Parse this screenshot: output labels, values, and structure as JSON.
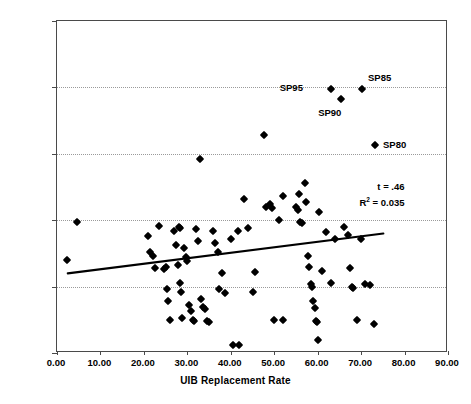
{
  "chart_data": {
    "type": "scatter",
    "title": "",
    "xlabel": "UIB Replacement Rate",
    "ylabel": "Unemployment Rate",
    "xlim": [
      0,
      90
    ],
    "ylim": [
      0,
      25
    ],
    "xticks": [
      "0.00",
      "10.00",
      "20.00",
      "30.00",
      "40.00",
      "50.00",
      "60.00",
      "70.00",
      "80.00",
      "90.00"
    ],
    "yticks": [
      "0.00",
      "5.00",
      "10.00",
      "15.00",
      "20.00",
      "25.00"
    ],
    "xtick_values": [
      0,
      10,
      20,
      30,
      40,
      50,
      60,
      70,
      80,
      90
    ],
    "ytick_values": [
      0,
      5,
      10,
      15,
      20,
      25
    ],
    "grid": "horizontal-dotted",
    "gridline_values": [
      5,
      10,
      15,
      20
    ],
    "legend": "none",
    "marker": "filled-diamond",
    "marker_color": "#000000",
    "points": [
      [
        2.2,
        7.0
      ],
      [
        4.6,
        9.9
      ],
      [
        21.0,
        8.8
      ],
      [
        21.4,
        7.6
      ],
      [
        22.2,
        7.3
      ],
      [
        22.6,
        6.4
      ],
      [
        23.4,
        9.6
      ],
      [
        24.6,
        6.3
      ],
      [
        25.0,
        6.5
      ],
      [
        25.4,
        4.8
      ],
      [
        25.6,
        3.9
      ],
      [
        26.0,
        2.5
      ],
      [
        27.0,
        9.2
      ],
      [
        27.4,
        8.1
      ],
      [
        27.8,
        6.6
      ],
      [
        28.0,
        9.5
      ],
      [
        28.2,
        9.4
      ],
      [
        28.4,
        5.3
      ],
      [
        28.6,
        4.6
      ],
      [
        28.8,
        2.6
      ],
      [
        29.2,
        7.9
      ],
      [
        29.6,
        7.2
      ],
      [
        30.0,
        6.9
      ],
      [
        30.4,
        3.6
      ],
      [
        30.8,
        3.2
      ],
      [
        31.2,
        2.5
      ],
      [
        31.6,
        2.4
      ],
      [
        32.0,
        9.3
      ],
      [
        32.4,
        8.4
      ],
      [
        33.0,
        14.6
      ],
      [
        33.2,
        4.1
      ],
      [
        33.6,
        3.5
      ],
      [
        34.0,
        3.3
      ],
      [
        34.6,
        2.4
      ],
      [
        35.0,
        2.3
      ],
      [
        36.0,
        9.2
      ],
      [
        36.4,
        8.3
      ],
      [
        37.0,
        7.6
      ],
      [
        37.4,
        4.8
      ],
      [
        38.0,
        6.0
      ],
      [
        38.6,
        4.5
      ],
      [
        40.0,
        8.6
      ],
      [
        40.6,
        0.6
      ],
      [
        41.6,
        9.2
      ],
      [
        43.0,
        11.6
      ],
      [
        44.0,
        9.4
      ],
      [
        45.0,
        4.6
      ],
      [
        47.6,
        16.4
      ],
      [
        48.0,
        11.0
      ],
      [
        49.0,
        11.2
      ],
      [
        49.4,
        10.9
      ],
      [
        50.0,
        2.5
      ],
      [
        51.0,
        10.0
      ],
      [
        52.0,
        11.8
      ],
      [
        55.0,
        11.0
      ],
      [
        55.4,
        10.8
      ],
      [
        55.8,
        12.0
      ],
      [
        56.0,
        9.9
      ],
      [
        56.4,
        9.8
      ],
      [
        57.0,
        12.8
      ],
      [
        57.4,
        11.4
      ],
      [
        57.8,
        7.3
      ],
      [
        58.0,
        6.5
      ],
      [
        58.4,
        5.2
      ],
      [
        58.8,
        5.0
      ],
      [
        59.0,
        3.9
      ],
      [
        59.4,
        3.4
      ],
      [
        59.6,
        2.4
      ],
      [
        59.8,
        2.3
      ],
      [
        60.0,
        1.0
      ],
      [
        60.4,
        10.6
      ],
      [
        61.0,
        6.2
      ],
      [
        62.0,
        9.1
      ],
      [
        63.0,
        5.3
      ],
      [
        64.0,
        8.6
      ],
      [
        66.0,
        9.5
      ],
      [
        67.0,
        8.9
      ],
      [
        67.4,
        6.4
      ],
      [
        68.0,
        5.0
      ],
      [
        68.2,
        4.9
      ],
      [
        69.0,
        2.5
      ],
      [
        70.0,
        8.6
      ],
      [
        71.0,
        5.2
      ],
      [
        72.0,
        5.1
      ],
      [
        73.0,
        2.2
      ],
      [
        52.0,
        2.5
      ],
      [
        45.6,
        6.1
      ],
      [
        42.0,
        0.6
      ]
    ],
    "highlighted_points": [
      {
        "label": "SP95",
        "x": 63.0,
        "y": 19.9,
        "label_dx": -34,
        "label_dy": -1
      },
      {
        "label": "SP90",
        "x": 65.4,
        "y": 19.1,
        "label_dx": -6,
        "label_dy": 14
      },
      {
        "label": "SP85",
        "x": 70.2,
        "y": 19.9,
        "label_dx": 6,
        "label_dy": -11
      },
      {
        "label": "SP80",
        "x": 73.2,
        "y": 15.7,
        "label_dx": 8,
        "label_dy": 0
      }
    ],
    "trendline": {
      "x0": 2.5,
      "y0": 5.88,
      "x1": 75.5,
      "y1": 8.9,
      "color": "#000000",
      "width": 2.2
    },
    "annotations": {
      "t_stat": "t = .46",
      "r_squared_prefix": "R",
      "r_squared_exponent": "2",
      "r_squared_value": " = 0.035",
      "x": 80.0,
      "y": 12.6
    }
  }
}
